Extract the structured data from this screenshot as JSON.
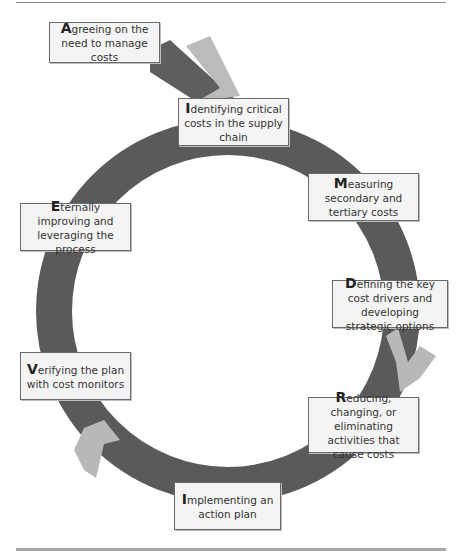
{
  "diagram": {
    "type": "cycle",
    "colors": {
      "ring": "#5a5a5a",
      "arrow_light": "#b8b8b8",
      "box_bg": "#f4f4f4",
      "box_border": "#6a6a6a",
      "rule": "#9a9a9a"
    },
    "entry_step": {
      "cap": "A",
      "rest": "greeing on the need to manage costs"
    },
    "steps": [
      {
        "cap": "I",
        "rest": "dentifying critical costs in the supply chain"
      },
      {
        "cap": "M",
        "rest": "easuring secondary and tertiary costs"
      },
      {
        "cap": "D",
        "rest": "efining the key cost drivers and developing strategic options"
      },
      {
        "cap": "R",
        "rest": "educing, changing, or eliminating activities that cause costs"
      },
      {
        "cap": "I",
        "rest": "mplementing an action plan"
      },
      {
        "cap": "V",
        "rest": "erifying the plan with cost monitors"
      },
      {
        "cap": "E",
        "rest": "ternally improving and leveraging the process"
      }
    ]
  }
}
